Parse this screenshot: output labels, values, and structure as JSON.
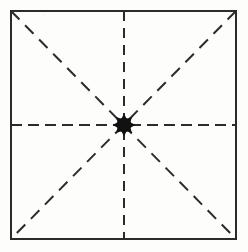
{
  "figure": {
    "type": "geometric-diagram",
    "caption": "",
    "canvas": {
      "width": 248,
      "height": 252,
      "background_color": "#fdfdfc"
    },
    "square": {
      "name": "square-outline",
      "left": 11,
      "top": 11,
      "right": 236,
      "bottom": 239,
      "width": 225,
      "height": 228,
      "stroke_color": "#2b2b2b",
      "stroke_width": 2,
      "fill": "none"
    },
    "dashed_lines": [
      {
        "name": "vertical-median",
        "label": "vertical median",
        "x1": 124,
        "y1": 11,
        "x2": 124,
        "y2": 239,
        "stroke_color": "#2b2b2b",
        "stroke_width": 2,
        "dash": "10 7"
      },
      {
        "name": "horizontal-median",
        "label": "horizontal median",
        "x1": 11,
        "y1": 125,
        "x2": 236,
        "y2": 125,
        "stroke_color": "#2b2b2b",
        "stroke_width": 2,
        "dash": "11 6"
      },
      {
        "name": "diagonal-tl-br",
        "label": "diagonal top-left to bottom-right",
        "x1": 11,
        "y1": 11,
        "x2": 236,
        "y2": 239,
        "stroke_color": "#2b2b2b",
        "stroke_width": 2,
        "dash": "12 8"
      },
      {
        "name": "diagonal-tr-bl",
        "label": "diagonal top-right to bottom-left",
        "x1": 236,
        "y1": 11,
        "x2": 11,
        "y2": 239,
        "stroke_color": "#2b2b2b",
        "stroke_width": 2,
        "dash": "12 8"
      }
    ],
    "center_point": {
      "name": "center-point",
      "label": "centre",
      "cx": 124,
      "cy": 125,
      "radius": 8,
      "shape": "star-blob",
      "spike_count": 8,
      "fill_color": "#111111"
    },
    "colors": {
      "ink": "#2b2b2b",
      "center_fill": "#111111",
      "paper": "#fdfdfc"
    }
  }
}
